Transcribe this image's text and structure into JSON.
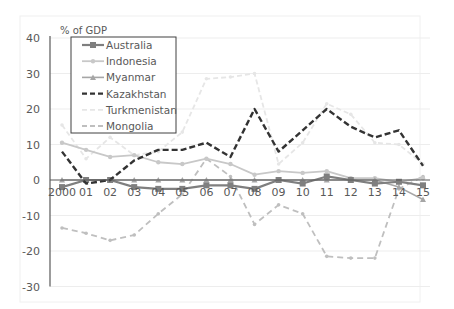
{
  "chart_data": {
    "type": "line",
    "title": "",
    "ylabel": "% of GDP",
    "xlabel": "",
    "ylim": [
      -30,
      40
    ],
    "yticks": [
      40,
      30,
      20,
      10,
      0,
      -10,
      -20,
      -30
    ],
    "grid": true,
    "legend_position": "upper-left-inside",
    "categories": [
      "2000",
      "01",
      "02",
      "03",
      "04",
      "05",
      "06",
      "07",
      "08",
      "09",
      "10",
      "11",
      "12",
      "13",
      "14",
      "15"
    ],
    "series": [
      {
        "name": "Australia",
        "style": "solid-square-marker",
        "color": "#7f7f7f",
        "values": [
          -2,
          0,
          0,
          -2,
          -2.5,
          -2.5,
          -1.5,
          -1.5,
          -2.5,
          0,
          -1,
          1,
          0,
          -1,
          -0.5,
          -1.5
        ]
      },
      {
        "name": "Indonesia",
        "style": "solid-plus-marker",
        "color": "#c8c8c8",
        "values": [
          10.5,
          8.5,
          6.5,
          7,
          5,
          4.5,
          6,
          4.5,
          1.5,
          2.5,
          2,
          2.5,
          0.5,
          0.5,
          -0.5,
          0.5
        ]
      },
      {
        "name": "Myanmar",
        "style": "solid-triangle-marker",
        "color": "#a6a6a6",
        "values": [
          0,
          0,
          0,
          0,
          0,
          0,
          0,
          0,
          0,
          0,
          0,
          0,
          0,
          0,
          -2,
          -5.5
        ]
      },
      {
        "name": "Kazakhstan",
        "style": "dashed-bold",
        "color": "#333333",
        "values": [
          8,
          -1,
          0,
          5.5,
          8.5,
          8.5,
          10.5,
          6.5,
          20,
          8,
          14,
          20,
          15,
          12,
          14,
          4
        ]
      },
      {
        "name": "Turkmenistan",
        "style": "dashed-light",
        "color": "#e6e6e6",
        "values": [
          15.5,
          6,
          12,
          7,
          8,
          13.5,
          28.5,
          29,
          30,
          4.5,
          10.5,
          21.5,
          18.5,
          10.5,
          10,
          4.5
        ]
      },
      {
        "name": "Mongolia",
        "style": "dashed-medium",
        "color": "#bfbfbf",
        "values": [
          -13.5,
          -15,
          -17,
          -15.5,
          -9.5,
          -4,
          6,
          1,
          -12.5,
          -7,
          -9.5,
          -21.5,
          -22,
          -22,
          -2.5,
          1
        ]
      }
    ]
  },
  "axis": {
    "ylabel": "% of GDP",
    "yticks": [
      "40",
      "30",
      "20",
      "10",
      "0",
      "-10",
      "-20",
      "-30"
    ],
    "xticks": [
      "2000",
      "01",
      "02",
      "03",
      "04",
      "05",
      "06",
      "07",
      "08",
      "09",
      "10",
      "11",
      "12",
      "13",
      "14",
      "15"
    ]
  },
  "legend": {
    "items": [
      "Australia",
      "Indonesia",
      "Myanmar",
      "Kazakhstan",
      "Turkmenistan",
      "Mongolia"
    ]
  }
}
